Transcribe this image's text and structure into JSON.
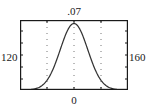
{
  "figure": {
    "name": "normal-distribution-thumbnail",
    "background_color": "#ffffff",
    "frame_color": "#1a1a1a",
    "curve_color": "#333333",
    "grid_color": "#777777"
  },
  "labels": {
    "top": ".07",
    "bottom": "0",
    "left": "120",
    "right": "160"
  },
  "chart_data": {
    "type": "line",
    "title": "",
    "subtitle": "",
    "xlabel": "",
    "ylabel": "",
    "xlim": [
      120,
      160
    ],
    "ylim": [
      0,
      0.07
    ],
    "grid": true,
    "grid_orientation": "vertical-dotted",
    "legend": "none",
    "axis_tick_labels": {
      "top": ".07",
      "bottom": "0",
      "left": "120",
      "right": "160"
    },
    "tick_positions_x": [
      130,
      140,
      150
    ],
    "frame": "box",
    "series": [
      {
        "name": "normal-density",
        "distribution": "normal",
        "mean": 140,
        "std": 5.1,
        "peak_value": 0.0665,
        "x": [
          120,
          122,
          124,
          126,
          128,
          130,
          132,
          134,
          136,
          138,
          140,
          142,
          144,
          146,
          148,
          150,
          152,
          154,
          156,
          158,
          160
        ],
        "values": [
          0.00018,
          0.00055,
          0.00153,
          0.00382,
          0.00849,
          0.01683,
          0.02975,
          0.04691,
          0.06605,
          0.08311,
          0.09346,
          0.09346,
          0.08311,
          0.06605,
          0.04691,
          0.02975,
          0.01683,
          0.00849,
          0.00382,
          0.00153,
          0.00055
        ]
      }
    ]
  }
}
